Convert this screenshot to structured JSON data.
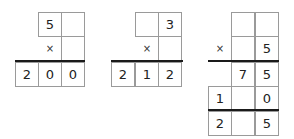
{
  "puzzles": [
    {
      "rows": [
        [
          "",
          "5",
          ""
        ],
        [
          "",
          "×",
          ""
        ],
        [
          "2",
          "0",
          "0"
        ]
      ]
    },
    {
      "rows": [
        [
          "",
          "",
          "3"
        ],
        [
          "",
          "×",
          ""
        ],
        [
          "2",
          "1",
          "2"
        ]
      ]
    },
    {
      "rows": [
        [
          "",
          "",
          ""
        ],
        [
          "×",
          "",
          "5"
        ],
        [
          "",
          "7",
          "5"
        ],
        [
          "1",
          "",
          "0"
        ],
        [
          "2",
          "",
          "5"
        ]
      ]
    }
  ]
}
